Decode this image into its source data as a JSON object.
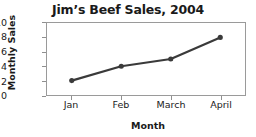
{
  "chart_data": {
    "type": "line",
    "title": "Jim’s Beef Sales, 2004",
    "xlabel": "Month",
    "ylabel": "Monthly Sales",
    "categories": [
      "Jan",
      "Feb",
      "March",
      "April"
    ],
    "values": [
      2,
      4,
      5,
      8
    ],
    "ylim": [
      0,
      10
    ],
    "yticks": [
      "0",
      "2",
      "4",
      "6",
      "8",
      "10"
    ],
    "ytick_values": [
      0,
      2,
      4,
      6,
      8,
      10
    ],
    "grid": false,
    "legend": "none",
    "series_color": "#3a3a3a",
    "frame_color": "#9a9a9a",
    "background": "#ffffff",
    "marker": "circle"
  }
}
